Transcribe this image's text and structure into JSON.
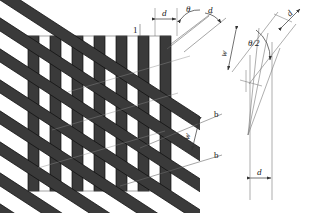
{
  "colors": {
    "stripe_fill": "#3a3a3a",
    "stripe_edge": "#111111",
    "line": "#555555",
    "thin_line": "#777777",
    "text": "#1a1a1a",
    "background": "#ffffff"
  },
  "main_view": {
    "vertical_grating": {
      "count": 7,
      "stripe_width": 11,
      "pitch": 22,
      "x_start": 28,
      "y_top": 36,
      "y_bottom": 191
    },
    "diagonal_grating": {
      "count": 7,
      "stripe_width": 11,
      "angle_deg": 57,
      "direction": "up-to-the-right"
    },
    "labels": {
      "ref_one": "1",
      "pitch_d": "d",
      "angle_theta": "θ",
      "pitch_d2": "d",
      "moire_width_w": "w",
      "band_b_top": "b",
      "band_b_bottom": "b"
    }
  },
  "detail_view": {
    "labels": {
      "moire_width_w": "w",
      "half_angle": "θ/2",
      "pitch_d_top": "d",
      "pitch_d_bottom": "d"
    }
  }
}
